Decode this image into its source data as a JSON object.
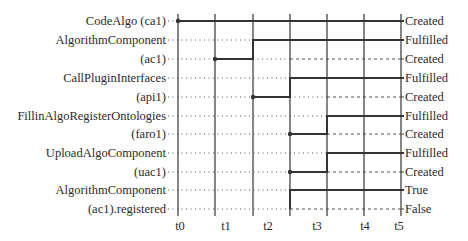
{
  "diagram": {
    "type": "timing-diagram",
    "time_labels": [
      "t0",
      "t1",
      "t2",
      "t3",
      "t4",
      "t5"
    ],
    "signals": [
      {
        "name_lines": [
          "CodeAlgo (ca1)"
        ],
        "states": [
          "Created"
        ],
        "transition": "Created at t0"
      },
      {
        "name_lines": [
          "AlgorithmComponent",
          "(ac1)"
        ],
        "states": [
          "Fulfilled",
          "Created"
        ],
        "transition": "Created at t1, Fulfilled at t2"
      },
      {
        "name_lines": [
          "CallPluginInterfaces",
          "(api1)"
        ],
        "states": [
          "Fulfilled",
          "Created"
        ],
        "transition": "Created at t2, Fulfilled at t3"
      },
      {
        "name_lines": [
          "FillinAlgoRegisterOntologies",
          "(faro1)"
        ],
        "states": [
          "Fulfilled",
          "Created"
        ],
        "transition": "Created at t3, Fulfilled at t4"
      },
      {
        "name_lines": [
          "UploadAlgoComponent",
          "(uac1)"
        ],
        "states": [
          "Fulfilled",
          "Created"
        ],
        "transition": "Created at t3, Fulfilled at t4"
      },
      {
        "name_lines": [
          "AlgorithmComponent",
          "(ac1).registered"
        ],
        "states": [
          "True",
          "False"
        ],
        "transition": "True at t3"
      }
    ]
  }
}
